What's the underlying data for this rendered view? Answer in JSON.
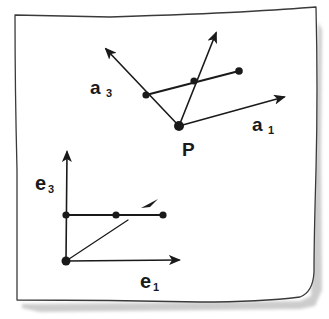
{
  "diagram": {
    "type": "hand-drawn vector sketch on paper",
    "colors": {
      "ink": "#1a1a1a",
      "paper": "#ffffff",
      "shadow": "#bdbdbd"
    },
    "upper_figure": {
      "description": "Oblique frame at point P with basis vectors a1 and a3; a point decomposed along them",
      "origin_label": "P",
      "axis_labels": [
        {
          "letter": "a",
          "subscript": "3"
        },
        {
          "letter": "a",
          "subscript": "1"
        }
      ],
      "points": {
        "P": [
          179,
          126
        ],
        "on_a3": [
          146,
          95
        ],
        "middle": [
          194,
          81
        ],
        "end": [
          239,
          71
        ]
      },
      "arrows": [
        {
          "name": "a3-vector",
          "from": [
            179,
            126
          ],
          "to": [
            104,
            47
          ]
        },
        {
          "name": "a1-vector",
          "from": [
            179,
            126
          ],
          "to": [
            286,
            96
          ]
        },
        {
          "name": "oblique-vector",
          "from": [
            179,
            126
          ],
          "to": [
            217,
            30
          ]
        }
      ]
    },
    "lower_figure": {
      "description": "Orthogonal frame with basis vectors e1 and e3",
      "axis_labels": [
        {
          "letter": "e",
          "subscript": "3"
        },
        {
          "letter": "e",
          "subscript": "1"
        }
      ],
      "points": {
        "origin": [
          66,
          261
        ],
        "on_e3": [
          66,
          215
        ],
        "middle": [
          116,
          215
        ],
        "end": [
          163,
          215
        ]
      },
      "arrows": [
        {
          "name": "e3-vector",
          "from": [
            66,
            261
          ],
          "to": [
            67,
            150
          ]
        },
        {
          "name": "e1-vector",
          "from": [
            66,
            261
          ],
          "to": [
            181,
            260
          ]
        },
        {
          "name": "diagonal-vector",
          "from": [
            66,
            261
          ],
          "to": [
            152,
            202
          ]
        }
      ]
    }
  }
}
